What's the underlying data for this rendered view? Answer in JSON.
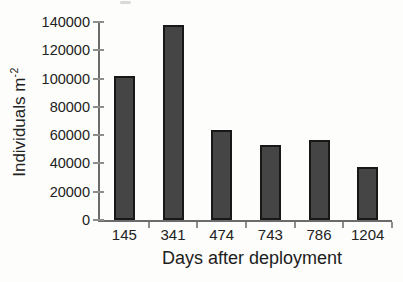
{
  "chart_data": {
    "type": "bar",
    "title": "",
    "categories": [
      "145",
      "341",
      "474",
      "743",
      "786",
      "1204"
    ],
    "values": [
      102000,
      138000,
      64000,
      53000,
      56500,
      37500
    ],
    "xlabel": "Days after deployment",
    "ylabel": "Individuals m",
    "ylabel_superscript": "-2",
    "ylim": [
      0,
      140000
    ],
    "yticks": [
      0,
      20000,
      40000,
      60000,
      80000,
      100000,
      120000,
      140000
    ],
    "grid": false,
    "legend": null,
    "bar_width_px": 21,
    "bar_color": "#454545",
    "bar_border_color": "#181818",
    "axis_color": "#6b6b6b",
    "tick_color": "#8d8d8d",
    "text_color": "#222222",
    "background_color": "#fdfdfb"
  }
}
